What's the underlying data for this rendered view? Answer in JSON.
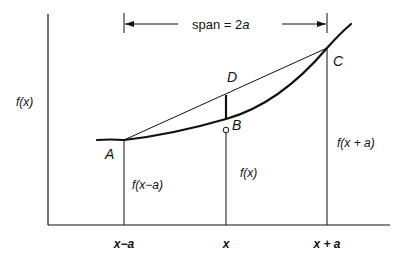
{
  "diagram": {
    "span_label": "span = 2",
    "span_var": "a",
    "y_axis_label": "f(x)",
    "points": {
      "A": "A",
      "B": "B",
      "C": "C",
      "D": "D"
    },
    "function_labels": {
      "left": "f(x−a)",
      "middle": "f(x)",
      "right": "f(x + a)"
    },
    "x_ticks": [
      "x−a",
      "x",
      "x + a"
    ],
    "colors": {
      "line": "#111111",
      "background": "#ffffff"
    }
  }
}
